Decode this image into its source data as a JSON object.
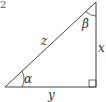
{
  "diagram": {
    "type": "right-triangle",
    "corner_glyph": "2",
    "labels": {
      "hypotenuse": "z",
      "vertical_leg": "x",
      "horizontal_leg": "y",
      "bottom_left_angle": "α",
      "top_angle": "β"
    },
    "colors": {
      "stroke": "#444444",
      "text": "#333333",
      "background": "#ffffff"
    }
  }
}
